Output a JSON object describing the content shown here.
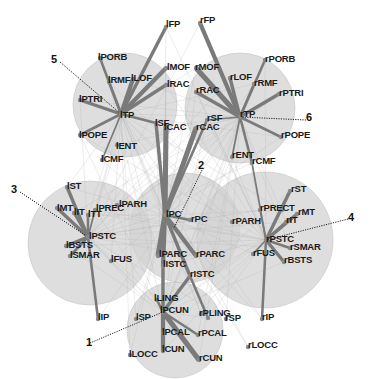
{
  "figure": {
    "type": "brain-connectivity-network",
    "background": "#ffffff",
    "module_fill": "#d3d3d3",
    "edge_color": "#7a7a7a",
    "faint_edge_color": "#b0b0b0",
    "dotted_color": "#222222"
  },
  "modules": [
    {
      "id": "1",
      "label": "1",
      "hub": "lPCUN",
      "cx": 175,
      "cy": 330,
      "r": 48,
      "num_x": 90,
      "num_y": 343
    },
    {
      "id": "2",
      "label": "2",
      "hub": "lPC",
      "cx": 185,
      "cy": 228,
      "r": 55,
      "num_x": 202,
      "num_y": 166
    },
    {
      "id": "3",
      "label": "3",
      "hub": "lPSTC",
      "cx": 90,
      "cy": 243,
      "r": 62,
      "num_x": 15,
      "num_y": 190
    },
    {
      "id": "4",
      "label": "4",
      "hub": "rPSTC",
      "cx": 265,
      "cy": 240,
      "r": 68,
      "num_x": 352,
      "num_y": 218
    },
    {
      "id": "5",
      "label": "5",
      "hub": "lTP",
      "cx": 125,
      "cy": 105,
      "r": 52,
      "num_x": 55,
      "num_y": 60
    },
    {
      "id": "6",
      "label": "6",
      "hub": "rTP",
      "cx": 240,
      "cy": 108,
      "r": 55,
      "num_x": 310,
      "num_y": 118
    }
  ],
  "nodes": [
    {
      "name": "lFP",
      "x": 166,
      "y": 27
    },
    {
      "name": "rFP",
      "x": 200,
      "y": 23
    },
    {
      "name": "lPORB",
      "x": 100,
      "y": 58
    },
    {
      "name": "lRMF",
      "x": 109,
      "y": 82
    },
    {
      "name": "lLOF",
      "x": 133,
      "y": 79
    },
    {
      "name": "lMOF",
      "x": 166,
      "y": 68
    },
    {
      "name": "lRAC",
      "x": 166,
      "y": 85
    },
    {
      "name": "lPTRI",
      "x": 80,
      "y": 100
    },
    {
      "name": "lTP",
      "x": 121,
      "y": 114
    },
    {
      "name": "lPOPE",
      "x": 80,
      "y": 135
    },
    {
      "name": "lENT",
      "x": 117,
      "y": 145
    },
    {
      "name": "lCMF",
      "x": 102,
      "y": 160
    },
    {
      "name": "lSF",
      "x": 156,
      "y": 123
    },
    {
      "name": "lCAC",
      "x": 166,
      "y": 126
    },
    {
      "name": "rMOF",
      "x": 196,
      "y": 68
    },
    {
      "name": "rRAC",
      "x": 196,
      "y": 92
    },
    {
      "name": "rLOF",
      "x": 230,
      "y": 78
    },
    {
      "name": "rRMF",
      "x": 254,
      "y": 84
    },
    {
      "name": "rPORB",
      "x": 265,
      "y": 60
    },
    {
      "name": "rPTRI",
      "x": 279,
      "y": 94
    },
    {
      "name": "rTP",
      "x": 240,
      "y": 117
    },
    {
      "name": "rSF",
      "x": 207,
      "y": 120
    },
    {
      "name": "rCAC",
      "x": 196,
      "y": 128
    },
    {
      "name": "rPOPE",
      "x": 281,
      "y": 137
    },
    {
      "name": "rENT",
      "x": 232,
      "y": 157
    },
    {
      "name": "rCMF",
      "x": 252,
      "y": 163
    },
    {
      "name": "lST",
      "x": 67,
      "y": 187
    },
    {
      "name": "lMT",
      "x": 57,
      "y": 208
    },
    {
      "name": "lIT",
      "x": 74,
      "y": 213
    },
    {
      "name": "lTT",
      "x": 88,
      "y": 215
    },
    {
      "name": "lPREC",
      "x": 95,
      "y": 210
    },
    {
      "name": "lPARH",
      "x": 117,
      "y": 205
    },
    {
      "name": "lPSTC",
      "x": 88,
      "y": 237
    },
    {
      "name": "lBSTS",
      "x": 66,
      "y": 246
    },
    {
      "name": "lSMAR",
      "x": 70,
      "y": 256
    },
    {
      "name": "lFUS",
      "x": 111,
      "y": 261
    },
    {
      "name": "lPC",
      "x": 165,
      "y": 215
    },
    {
      "name": "rPC",
      "x": 190,
      "y": 220
    },
    {
      "name": "lPARC",
      "x": 158,
      "y": 256
    },
    {
      "name": "lISTC",
      "x": 163,
      "y": 266
    },
    {
      "name": "rPARC",
      "x": 196,
      "y": 256
    },
    {
      "name": "rISTC",
      "x": 190,
      "y": 276
    },
    {
      "name": "rST",
      "x": 290,
      "y": 191
    },
    {
      "name": "rPREC",
      "x": 260,
      "y": 210
    },
    {
      "name": "rCT",
      "x": 282,
      "y": 210
    },
    {
      "name": "rMT",
      "x": 297,
      "y": 214
    },
    {
      "name": "rIT",
      "x": 286,
      "y": 222
    },
    {
      "name": "rPARH",
      "x": 232,
      "y": 222
    },
    {
      "name": "rPSTC",
      "x": 266,
      "y": 240
    },
    {
      "name": "rSMAR",
      "x": 290,
      "y": 248
    },
    {
      "name": "rFUS",
      "x": 253,
      "y": 254
    },
    {
      "name": "rBSTS",
      "x": 284,
      "y": 262
    },
    {
      "name": "lIP",
      "x": 98,
      "y": 319
    },
    {
      "name": "lSP",
      "x": 136,
      "y": 319
    },
    {
      "name": "lLING",
      "x": 157,
      "y": 300
    },
    {
      "name": "lPCUN",
      "x": 163,
      "y": 312
    },
    {
      "name": "rPLING",
      "x": 201,
      "y": 314
    },
    {
      "name": "rPCUN",
      "x": 208,
      "y": 318
    },
    {
      "name": "rSP",
      "x": 226,
      "y": 319
    },
    {
      "name": "rIP",
      "x": 262,
      "y": 319
    },
    {
      "name": "lPCAL",
      "x": 163,
      "y": 333
    },
    {
      "name": "rPCAL",
      "x": 198,
      "y": 335
    },
    {
      "name": "lLOCC",
      "x": 130,
      "y": 355
    },
    {
      "name": "lCUN",
      "x": 163,
      "y": 351
    },
    {
      "name": "rCUN",
      "x": 199,
      "y": 360
    },
    {
      "name": "rLOCC",
      "x": 248,
      "y": 347
    }
  ],
  "labels": [
    {
      "text": "lFP",
      "x": 166,
      "y": 23
    },
    {
      "text": "rFP",
      "x": 200,
      "y": 19
    },
    {
      "text": "lPORB",
      "x": 98,
      "y": 56
    },
    {
      "text": "lRMF",
      "x": 108,
      "y": 79
    },
    {
      "text": "lLOF",
      "x": 131,
      "y": 77
    },
    {
      "text": "lMOF",
      "x": 167,
      "y": 66
    },
    {
      "text": "lRAC",
      "x": 167,
      "y": 83
    },
    {
      "text": "lPTRI",
      "x": 79,
      "y": 98
    },
    {
      "text": "lTP",
      "x": 120,
      "y": 114
    },
    {
      "text": "lPOPE",
      "x": 79,
      "y": 134
    },
    {
      "text": "lENT",
      "x": 116,
      "y": 145
    },
    {
      "text": "lCMF",
      "x": 101,
      "y": 158
    },
    {
      "text": "lSF",
      "x": 155,
      "y": 122
    },
    {
      "text": "lCAC",
      "x": 164,
      "y": 126
    },
    {
      "text": "rMOF",
      "x": 195,
      "y": 66
    },
    {
      "text": "rRAC",
      "x": 196,
      "y": 89
    },
    {
      "text": "rLOF",
      "x": 230,
      "y": 76
    },
    {
      "text": "rRMF",
      "x": 254,
      "y": 82
    },
    {
      "text": "rPORB",
      "x": 265,
      "y": 58
    },
    {
      "text": "rPTRI",
      "x": 279,
      "y": 92
    },
    {
      "text": "rTP",
      "x": 240,
      "y": 113
    },
    {
      "text": "rSF",
      "x": 207,
      "y": 117
    },
    {
      "text": "rCAC",
      "x": 196,
      "y": 126
    },
    {
      "text": "rPOPE",
      "x": 281,
      "y": 134
    },
    {
      "text": "rENT",
      "x": 232,
      "y": 154
    },
    {
      "text": "rCMF",
      "x": 252,
      "y": 160
    },
    {
      "text": "lST",
      "x": 67,
      "y": 185
    },
    {
      "text": "lMT",
      "x": 57,
      "y": 207
    },
    {
      "text": "lIT",
      "x": 74,
      "y": 211
    },
    {
      "text": "lTT",
      "x": 88,
      "y": 213
    },
    {
      "text": "lPREC",
      "x": 96,
      "y": 207
    },
    {
      "text": "lPARH",
      "x": 119,
      "y": 203
    },
    {
      "text": "lPSTC",
      "x": 89,
      "y": 235
    },
    {
      "text": "lBSTS",
      "x": 66,
      "y": 244
    },
    {
      "text": "lSMAR",
      "x": 70,
      "y": 254
    },
    {
      "text": "lFUS",
      "x": 111,
      "y": 258
    },
    {
      "text": "lPC",
      "x": 166,
      "y": 213
    },
    {
      "text": "rPC",
      "x": 191,
      "y": 218
    },
    {
      "text": "lPARC",
      "x": 159,
      "y": 253
    },
    {
      "text": "lISTC",
      "x": 163,
      "y": 263
    },
    {
      "text": "rPARC",
      "x": 196,
      "y": 253
    },
    {
      "text": "rISTC",
      "x": 190,
      "y": 273
    },
    {
      "text": "rST",
      "x": 291,
      "y": 188
    },
    {
      "text": "rPRECT",
      "x": 260,
      "y": 207
    },
    {
      "text": "rMT",
      "x": 298,
      "y": 211
    },
    {
      "text": "rIT",
      "x": 286,
      "y": 219
    },
    {
      "text": "rPARH",
      "x": 232,
      "y": 220
    },
    {
      "text": "rPSTC",
      "x": 266,
      "y": 238
    },
    {
      "text": "rSMAR",
      "x": 290,
      "y": 246
    },
    {
      "text": "rFUS",
      "x": 253,
      "y": 252
    },
    {
      "text": "rBSTS",
      "x": 284,
      "y": 259
    },
    {
      "text": "lIP",
      "x": 98,
      "y": 316
    },
    {
      "text": "lSP",
      "x": 136,
      "y": 316
    },
    {
      "text": "lLING",
      "x": 154,
      "y": 297
    },
    {
      "text": "lPCUN",
      "x": 160,
      "y": 309
    },
    {
      "text": "rPLING",
      "x": 199,
      "y": 312
    },
    {
      "text": "rSP",
      "x": 225,
      "y": 317
    },
    {
      "text": "rIP",
      "x": 262,
      "y": 316
    },
    {
      "text": "lPCAL",
      "x": 162,
      "y": 331
    },
    {
      "text": "rPCAL",
      "x": 198,
      "y": 332
    },
    {
      "text": "lLOCC",
      "x": 129,
      "y": 353
    },
    {
      "text": "lCUN",
      "x": 162,
      "y": 348
    },
    {
      "text": "rCUN",
      "x": 199,
      "y": 357
    },
    {
      "text": "rLOCC",
      "x": 248,
      "y": 344
    }
  ],
  "strong_edges": [
    [
      "lTP",
      "lFP",
      4
    ],
    [
      "lTP",
      "lPORB",
      3
    ],
    [
      "lTP",
      "lRMF",
      3
    ],
    [
      "lTP",
      "lLOF",
      5
    ],
    [
      "lTP",
      "lMOF",
      5
    ],
    [
      "lTP",
      "lRAC",
      4
    ],
    [
      "lTP",
      "lPTRI",
      4
    ],
    [
      "lTP",
      "lPOPE",
      3
    ],
    [
      "lTP",
      "lSF",
      3
    ],
    [
      "lTP",
      "lCMF",
      2
    ],
    [
      "rTP",
      "rFP",
      5
    ],
    [
      "rTP",
      "rMOF",
      6
    ],
    [
      "rTP",
      "rPORB",
      3
    ],
    [
      "rTP",
      "rRMF",
      3
    ],
    [
      "rTP",
      "rLOF",
      4
    ],
    [
      "rTP",
      "rPTRI",
      4
    ],
    [
      "rTP",
      "rPOPE",
      3
    ],
    [
      "rTP",
      "rRAC",
      4
    ],
    [
      "rTP",
      "rSF",
      2
    ],
    [
      "rTP",
      "rENT",
      2
    ],
    [
      "rTP",
      "rCMF",
      3
    ],
    [
      "lPC",
      "lCAC",
      6
    ],
    [
      "lPC",
      "rCAC",
      6
    ],
    [
      "lPC",
      "lSF",
      4
    ],
    [
      "lPC",
      "rSF",
      3
    ],
    [
      "lPC",
      "lPARC",
      6
    ],
    [
      "lPC",
      "rPARC",
      5
    ],
    [
      "lPC",
      "rPC",
      3
    ],
    [
      "lPC",
      "lISTC",
      5
    ],
    [
      "lPC",
      "rISTC",
      4
    ],
    [
      "lPSTC",
      "lST",
      4
    ],
    [
      "lPSTC",
      "lMT",
      4
    ],
    [
      "lPSTC",
      "lIT",
      3
    ],
    [
      "lPSTC",
      "lTT",
      3
    ],
    [
      "lPSTC",
      "lBSTS",
      4
    ],
    [
      "lPSTC",
      "lSMAR",
      3
    ],
    [
      "lPSTC",
      "lIP",
      3
    ],
    [
      "lPSTC",
      "lPREC",
      2
    ],
    [
      "rPSTC",
      "rST",
      4
    ],
    [
      "rPSTC",
      "rMT",
      4
    ],
    [
      "rPSTC",
      "rIT",
      3
    ],
    [
      "rPSTC",
      "rPREC",
      2
    ],
    [
      "rPSTC",
      "rSMAR",
      3
    ],
    [
      "rPSTC",
      "rBSTS",
      4
    ],
    [
      "rPSTC",
      "rFUS",
      2
    ],
    [
      "rPSTC",
      "rIP",
      3
    ],
    [
      "rPSTC",
      "rCMF",
      2
    ],
    [
      "lPCUN",
      "rCUN",
      6
    ],
    [
      "lPCUN",
      "lCUN",
      5
    ],
    [
      "lPCUN",
      "lPCAL",
      4
    ],
    [
      "lPCUN",
      "lISTC",
      4
    ],
    [
      "lPCUN",
      "rISTC",
      4
    ],
    [
      "lPCUN",
      "lLING",
      3
    ],
    [
      "lPCUN",
      "rPCAL",
      3
    ],
    [
      "rPCUN",
      "rISTC",
      3
    ]
  ],
  "dotted_lines": [
    {
      "from": [
        90,
        343
      ],
      "to": [
        163,
        312
      ]
    },
    {
      "from": [
        202,
        170
      ],
      "to": [
        174,
        228
      ]
    },
    {
      "from": [
        20,
        192
      ],
      "to": [
        88,
        237
      ]
    },
    {
      "from": [
        348,
        219
      ],
      "to": [
        266,
        240
      ]
    },
    {
      "from": [
        60,
        62
      ],
      "to": [
        121,
        114
      ]
    },
    {
      "from": [
        306,
        120
      ],
      "to": [
        240,
        117
      ]
    }
  ]
}
